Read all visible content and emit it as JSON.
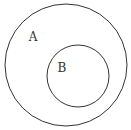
{
  "diagram": {
    "type": "venn-subset",
    "sets": [
      {
        "label": "A",
        "cx": 66,
        "cy": 65,
        "r": 61,
        "label_x": 33,
        "label_y": 41
      },
      {
        "label": "B",
        "cx": 78,
        "cy": 76,
        "r": 31,
        "label_x": 62,
        "label_y": 72
      }
    ],
    "stroke_color": "#333333",
    "background": "#ffffff"
  }
}
